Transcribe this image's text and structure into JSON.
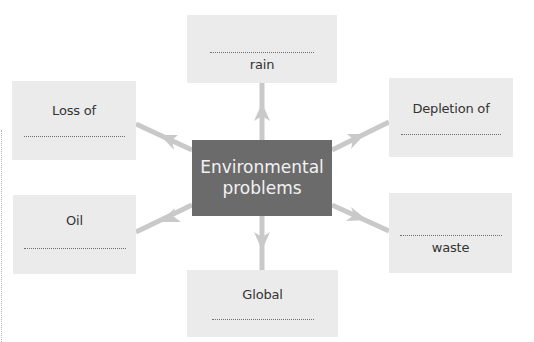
{
  "diagram": {
    "type": "mind-map",
    "center": {
      "line1": "Environmental",
      "line2": "problems"
    },
    "branches": [
      {
        "id": "top",
        "before_blank": "",
        "after_blank": "rain"
      },
      {
        "id": "upper-left",
        "before_blank": "Loss of",
        "after_blank": ""
      },
      {
        "id": "upper-right",
        "before_blank": "Depletion of",
        "after_blank": ""
      },
      {
        "id": "lower-left",
        "before_blank": "Oil",
        "after_blank": ""
      },
      {
        "id": "lower-right",
        "before_blank": "",
        "after_blank": "waste"
      },
      {
        "id": "bottom",
        "before_blank": "Global",
        "after_blank": ""
      }
    ],
    "colors": {
      "center_fill": "#6b6b6b",
      "center_text": "#f2f2f2",
      "box_fill": "#ebebeb",
      "arrow": "#c9c9c9",
      "text": "#333333"
    }
  }
}
